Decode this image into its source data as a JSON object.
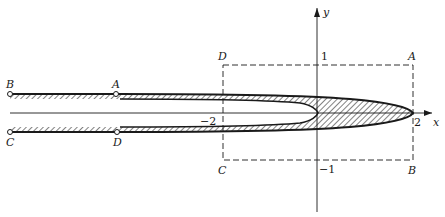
{
  "diagram": {
    "type": "conformal-map-region",
    "axes": {
      "x_label": "x",
      "y_label": "y"
    },
    "tick_labels": {
      "x_neg2": "−2",
      "x_2": "2",
      "y_1": "1",
      "y_neg1": "−1"
    },
    "rectangle_corners": {
      "top_left": "D",
      "top_right": "A",
      "bottom_left": "C",
      "bottom_right": "B"
    },
    "strip_points": {
      "top_left_end": "B",
      "top_marker": "A",
      "bottom_left_end": "C",
      "bottom_marker": "D"
    },
    "colors": {
      "ink": "#1a1a1a",
      "background": "#ffffff"
    }
  }
}
